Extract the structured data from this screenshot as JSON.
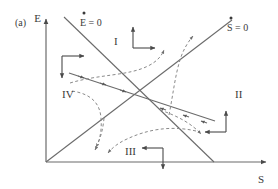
{
  "figure": {
    "panel_label": "(a)",
    "background_color": "#ffffff",
    "line_color": "#6b6b6b",
    "trajectory_color": "#8a8a8a",
    "text_color": "#3a3a3a"
  },
  "axes": {
    "y_label": "E",
    "x_label": "S",
    "x_origin_px": 46,
    "y_origin_px": 162,
    "x_end_px": 268,
    "y_top_px": 17
  },
  "nullclines": [
    {
      "id": "E-dot-zero",
      "label": "E = 0",
      "label_overdot": "·",
      "description": "downward-sloping nullcline from upper-left to S-axis",
      "x1": 64,
      "y1": 17,
      "x2": 214,
      "y2": 162
    },
    {
      "id": "S-dot-zero",
      "label": "S = 0",
      "label_overdot": "·",
      "description": "upward-sloping nullcline from origin to upper-right",
      "x1": 46,
      "y1": 162,
      "x2": 232,
      "y2": 20
    }
  ],
  "separatrix": {
    "id": "stable-manifold",
    "description": "solid line with inward arrowheads through the saddle point",
    "x1": 69,
    "y1": 73,
    "x2": 215,
    "y2": 121,
    "arrow_count": 6
  },
  "saddle_point": {
    "x": 139,
    "y": 96
  },
  "quadrants": [
    {
      "id": "quadrant-1",
      "label": "I",
      "label_x": 114,
      "label_y": 45,
      "arrow_corner": {
        "x": 133,
        "y": 48,
        "up": true,
        "right": true
      }
    },
    {
      "id": "quadrant-2",
      "label": "II",
      "label_x": 235,
      "label_y": 98,
      "arrow_corner": {
        "x": 226,
        "y": 132,
        "up": true,
        "left": true
      }
    },
    {
      "id": "quadrant-3",
      "label": "III",
      "label_x": 125,
      "label_y": 155,
      "arrow_corner": {
        "x": 163,
        "y": 148,
        "down": true,
        "left": true
      }
    },
    {
      "id": "quadrant-4",
      "label": "IV",
      "label_x": 62,
      "label_y": 98,
      "arrow_corner": {
        "x": 62,
        "y": 56,
        "down": true,
        "right": true
      }
    }
  ],
  "trajectories": [
    {
      "id": "traj-upper-left",
      "description": "dashed curve entering from left sweeping right toward quadrant I"
    },
    {
      "id": "traj-upper-right",
      "description": "dashed curve rising steeply into quadrant I"
    },
    {
      "id": "traj-lower-right",
      "description": "dashed curve sweeping right and down in quadrant II"
    },
    {
      "id": "traj-lower-left",
      "description": "dashed curve falling down-left into quadrant III"
    },
    {
      "id": "traj-left-branch",
      "description": "dashed curve bending down through quadrant IV"
    },
    {
      "id": "traj-right-branch",
      "description": "dashed curve bending up through quadrant II"
    }
  ]
}
